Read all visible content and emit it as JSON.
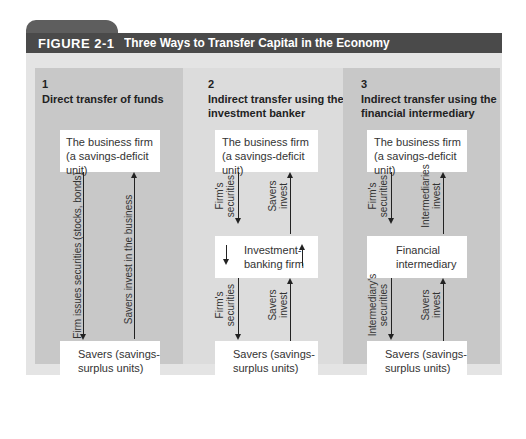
{
  "figure": {
    "label": "FIGURE 2-1",
    "title": "Three Ways to Transfer Capital in the Economy",
    "colors": {
      "header_dark": "#4a4a4a",
      "tab": "#5e5e5e",
      "panel": "#e4e4e4",
      "column_dark": "#c8c8c8",
      "column_light": "#dcdcdc",
      "box": "#ffffff"
    }
  },
  "columns": [
    {
      "number": "1",
      "heading": "Direct transfer of funds",
      "top_box": {
        "line1": "The business firm",
        "line2": "(a savings-deficit unit)"
      },
      "bottom_box": {
        "line1": "Savers (savings-",
        "line2": "surplus units)"
      },
      "down_label": "Firm issues securities (stocks, bonds)",
      "up_label": "Savers invest in the business"
    },
    {
      "number": "2",
      "heading_line1": "Indirect transfer using the",
      "heading_line2": "investment banker",
      "top_box": {
        "line1": "The business firm",
        "line2": "(a savings-deficit unit)"
      },
      "middle_box": {
        "line1": "Investment-",
        "line2": "banking firm"
      },
      "bottom_box": {
        "line1": "Savers (savings-",
        "line2": "surplus units)"
      },
      "upper_down_label": {
        "line1": "Firm's",
        "line2": "securities"
      },
      "upper_up_label": {
        "line1": "Savers",
        "line2": "invest"
      },
      "lower_down_label": {
        "line1": "Firm's",
        "line2": "securities"
      },
      "lower_up_label": {
        "line1": "Savers",
        "line2": "invest"
      }
    },
    {
      "number": "3",
      "heading_line1": "Indirect transfer using the",
      "heading_line2": "financial intermediary",
      "top_box": {
        "line1": "The business firm",
        "line2": "(a savings-deficit unit)"
      },
      "middle_box": {
        "line1": "Financial",
        "line2": "intermediary"
      },
      "bottom_box": {
        "line1": "Savers (savings-",
        "line2": "surplus units)"
      },
      "upper_down_label": {
        "line1": "Firm's",
        "line2": "securities"
      },
      "upper_up_label": {
        "line1": "Intermediaries",
        "line2": "invest"
      },
      "lower_down_label": {
        "line1": "Intermediary's",
        "line2": "securities"
      },
      "lower_up_label": {
        "line1": "Savers",
        "line2": "invest"
      }
    }
  ]
}
